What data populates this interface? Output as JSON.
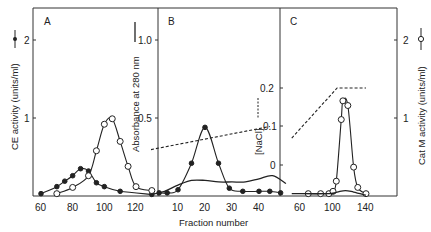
{
  "chart_data": [
    {
      "type": "line",
      "panel": "A",
      "xlabel": "",
      "ylabel": "CE activity (units/ml)",
      "xticks": [
        60,
        80,
        100,
        120
      ],
      "yticks": [
        1,
        2
      ],
      "xlim": [
        55,
        130
      ],
      "ylim": [
        0,
        2.4
      ],
      "series": [
        {
          "name": "CE activity (filled circles)",
          "marker": "filled-circle",
          "x": [
            60,
            70,
            75,
            80,
            85,
            90,
            95,
            100,
            110,
            130
          ],
          "y": [
            0.03,
            0.12,
            0.19,
            0.26,
            0.35,
            0.32,
            0.17,
            0.12,
            0.06,
            0.02
          ]
        },
        {
          "name": "Cat M activity (open circles)",
          "marker": "open-circle",
          "x": [
            70,
            80,
            90,
            95,
            100,
            105,
            110,
            115,
            120,
            130
          ],
          "y": [
            0.03,
            0.11,
            0.26,
            0.58,
            0.92,
            0.99,
            0.7,
            0.38,
            0.12,
            0.07
          ]
        }
      ]
    },
    {
      "type": "line",
      "panel": "B",
      "xlabel": "Fraction number",
      "ylabel": "Absorbance at 280 nm",
      "ylabel2": "[NaCl]",
      "xticks": [
        10,
        20,
        30,
        40
      ],
      "yticks": [
        0.5,
        1.0
      ],
      "yticks2": [
        0,
        0.1,
        0.2
      ],
      "xlim": [
        0,
        50
      ],
      "ylim": [
        0,
        1.2
      ],
      "series": [
        {
          "name": "CE activity (filled circles)",
          "marker": "filled-circle",
          "x": [
            3,
            6,
            10,
            15,
            20,
            25,
            29,
            34,
            40,
            44,
            48
          ],
          "y": [
            0.02,
            0.02,
            0.04,
            0.21,
            0.44,
            0.21,
            0.05,
            0.03,
            0.03,
            0.03,
            0.02
          ]
        },
        {
          "name": "Absorbance at 280 nm (solid line)",
          "marker": "none",
          "x": [
            0,
            5,
            10,
            15,
            20,
            25,
            30,
            35,
            40,
            45,
            50
          ],
          "y": [
            0.01,
            0.03,
            0.07,
            0.1,
            0.1,
            0.09,
            0.09,
            0.09,
            0.11,
            0.13,
            0.08
          ]
        },
        {
          "name": "[NaCl] (dashed)",
          "marker": "none",
          "axis": "right",
          "x": [
            0,
            44
          ],
          "y": [
            0.04,
            0.1
          ]
        }
      ]
    },
    {
      "type": "line",
      "panel": "C",
      "xlabel": "",
      "ylabel": "Cat M activity (units/ml)",
      "xticks": [
        60,
        100,
        140
      ],
      "yticks": [
        1,
        2
      ],
      "xlim": [
        50,
        145
      ],
      "ylim": [
        0,
        2.4
      ],
      "series": [
        {
          "name": "Cat M activity (open circles)",
          "marker": "open-circle",
          "x": [
            70,
            85,
            95,
            100,
            104,
            110,
            112,
            118,
            125,
            130,
            140
          ],
          "y": [
            0.03,
            0.03,
            0.03,
            0.06,
            0.19,
            0.98,
            1.22,
            1.16,
            0.37,
            0.11,
            0.03
          ]
        },
        {
          "name": "Absorbance at 280 nm (solid line)",
          "marker": "none",
          "x": [
            50,
            95,
            105,
            115,
            125,
            140
          ],
          "y": [
            0.03,
            0.03,
            0.05,
            0.07,
            0.05,
            0.01
          ]
        },
        {
          "name": "[NaCl] (dashed)",
          "marker": "none",
          "axis": "NaCl",
          "x": [
            50,
            105,
            140
          ],
          "y": [
            0.07,
            0.2,
            0.2
          ]
        }
      ]
    }
  ],
  "labels": {
    "panel_a": "A",
    "panel_b": "B",
    "panel_c": "C",
    "y_left": "CE activity (units/ml)",
    "y_abs": "Absorbance at 280 nm",
    "y_nacl": "[NaCl]",
    "y_right": "Cat M activity (units/ml)",
    "x_label": "Fraction number",
    "left_ticks": [
      "1",
      "2"
    ],
    "abs_ticks": [
      "0.5",
      "1.0"
    ],
    "nacl_ticks": [
      "0",
      "0.1",
      "0.2"
    ],
    "right_ticks": [
      "1",
      "2"
    ],
    "a_xticks": [
      "60",
      "80",
      "100",
      "120"
    ],
    "b_xticks": [
      "10",
      "20",
      "30",
      "40"
    ],
    "c_xticks": [
      "60",
      "100",
      "140"
    ]
  }
}
